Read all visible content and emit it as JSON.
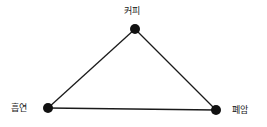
{
  "diagram": {
    "type": "triangle-graph",
    "line_color": "#1a1a1a",
    "node_color": "#111111",
    "nodes": [
      {
        "id": "coffee",
        "label": "커피",
        "x": 135,
        "y": 29
      },
      {
        "id": "smoking",
        "label": "흡연",
        "x": 48,
        "y": 108
      },
      {
        "id": "lung_cancer",
        "label": "폐암",
        "x": 216,
        "y": 110
      }
    ],
    "edges": [
      {
        "from": "smoking",
        "to": "coffee"
      },
      {
        "from": "coffee",
        "to": "lung_cancer"
      },
      {
        "from": "smoking",
        "to": "lung_cancer"
      }
    ]
  }
}
